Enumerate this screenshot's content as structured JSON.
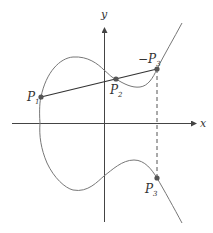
{
  "diagram": {
    "axes": {
      "x_label": "x",
      "y_label": "y"
    },
    "points": [
      {
        "id": "P1",
        "label": "P",
        "sub": "1",
        "neg": ""
      },
      {
        "id": "P2",
        "label": "P",
        "sub": "2",
        "neg": ""
      },
      {
        "id": "negP3",
        "label": "P",
        "sub": "3",
        "neg": "−"
      },
      {
        "id": "P3",
        "label": "P",
        "sub": "3",
        "neg": ""
      }
    ],
    "colors": {
      "curve": "#777777",
      "line": "#333333",
      "axis": "#444444",
      "point": "#555555",
      "dashed": "#555555"
    }
  }
}
